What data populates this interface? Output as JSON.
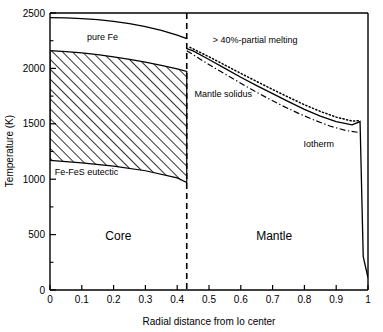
{
  "chart_data": {
    "type": "line",
    "title": "",
    "xlabel": "Radial distance from Io center",
    "ylabel": "Temperature (K)",
    "xlim": [
      0,
      1
    ],
    "ylim": [
      0,
      2500
    ],
    "xticks": [
      "0",
      "0.1",
      "0.2",
      "0.3",
      "0.4",
      "0.5",
      "0.6",
      "0.7",
      "0.8",
      "0.9",
      "1"
    ],
    "xtick_values": [
      0,
      0.1,
      0.2,
      0.3,
      0.4,
      0.5,
      0.6,
      0.7,
      0.8,
      0.9,
      1
    ],
    "yticks": [
      "0",
      "500",
      "1000",
      "1500",
      "2000",
      "2500"
    ],
    "ytick_values": [
      0,
      500,
      1000,
      1500,
      2000,
      2500
    ],
    "yminor_values": [
      250,
      750,
      1250,
      1750,
      2250
    ],
    "grid": false,
    "legend_position": "inline-annotations",
    "core_mantle_boundary": 0.43,
    "series": [
      {
        "name": "pure Fe",
        "style": "solid",
        "points": [
          [
            0.0,
            2458
          ],
          [
            0.05,
            2456
          ],
          [
            0.1,
            2450
          ],
          [
            0.15,
            2440
          ],
          [
            0.2,
            2424
          ],
          [
            0.25,
            2404
          ],
          [
            0.3,
            2378
          ],
          [
            0.35,
            2344
          ],
          [
            0.4,
            2300
          ],
          [
            0.43,
            2268
          ]
        ]
      },
      {
        "name": "Fe-FeS eutectic upper",
        "style": "solid",
        "points": [
          [
            0.0,
            2160
          ],
          [
            0.05,
            2152
          ],
          [
            0.1,
            2140
          ],
          [
            0.15,
            2124
          ],
          [
            0.2,
            2104
          ],
          [
            0.25,
            2082
          ],
          [
            0.3,
            2056
          ],
          [
            0.35,
            2028
          ],
          [
            0.4,
            1996
          ],
          [
            0.43,
            1972
          ]
        ]
      },
      {
        "name": "Fe-FeS eutectic lower",
        "style": "solid",
        "points": [
          [
            0.0,
            1170
          ],
          [
            0.1,
            1148
          ],
          [
            0.2,
            1118
          ],
          [
            0.3,
            1076
          ],
          [
            0.4,
            1012
          ],
          [
            0.43,
            970
          ]
        ]
      },
      {
        "name": "Mantle solidus",
        "style": "solid",
        "points": [
          [
            0.43,
            2178
          ],
          [
            0.45,
            2158
          ],
          [
            0.5,
            2080
          ],
          [
            0.55,
            2000
          ],
          [
            0.6,
            1920
          ],
          [
            0.65,
            1845
          ],
          [
            0.7,
            1772
          ],
          [
            0.75,
            1700
          ],
          [
            0.8,
            1630
          ],
          [
            0.85,
            1570
          ],
          [
            0.9,
            1520
          ],
          [
            0.95,
            1490
          ],
          [
            0.975,
            1520
          ],
          [
            0.985,
            300
          ],
          [
            1.0,
            110
          ]
        ]
      },
      {
        "name": "> 40%-partial melting",
        "style": "dotted",
        "points": [
          [
            0.44,
            2190
          ],
          [
            0.5,
            2105
          ],
          [
            0.55,
            2030
          ],
          [
            0.6,
            1955
          ],
          [
            0.65,
            1882
          ],
          [
            0.7,
            1810
          ],
          [
            0.75,
            1740
          ],
          [
            0.8,
            1672
          ],
          [
            0.85,
            1612
          ],
          [
            0.9,
            1560
          ],
          [
            0.95,
            1525
          ],
          [
            0.975,
            1528
          ]
        ]
      },
      {
        "name": "Iotherm",
        "style": "dashdot",
        "points": [
          [
            0.43,
            2160
          ],
          [
            0.48,
            2070
          ],
          [
            0.52,
            2000
          ],
          [
            0.58,
            1900
          ],
          [
            0.63,
            1816
          ],
          [
            0.68,
            1738
          ],
          [
            0.73,
            1664
          ],
          [
            0.78,
            1596
          ],
          [
            0.83,
            1534
          ],
          [
            0.88,
            1480
          ],
          [
            0.93,
            1440
          ],
          [
            0.975,
            1420
          ]
        ]
      }
    ],
    "annotations": [
      {
        "text": "pure Fe",
        "x": 0.165,
        "y": 2255
      },
      {
        "text": "> 40%-partial melting",
        "x": 0.645,
        "y": 2225
      },
      {
        "text": "Mantle solidus",
        "x": 0.545,
        "y": 1745
      },
      {
        "text": "Fe-FeS eutectic",
        "x": 0.115,
        "y": 1035
      },
      {
        "text": "Iotherm",
        "x": 0.845,
        "y": 1295
      },
      {
        "text": "Core",
        "x": 0.215,
        "y": 455
      },
      {
        "text": "Mantle",
        "x": 0.705,
        "y": 455
      }
    ],
    "hatched_region": {
      "label": "Fe-FeS eutectic field",
      "pattern": "diagonal-hatch",
      "x_range": [
        0.0,
        0.43
      ]
    }
  }
}
